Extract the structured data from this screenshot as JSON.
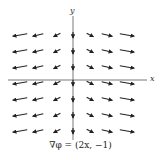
{
  "figure": {
    "title": "",
    "caption": "∇φ = (2x, −1)",
    "axes": {
      "x_label": "x",
      "y_label": "y"
    },
    "colors": {
      "arrow": "#222222",
      "axis": "#555555",
      "background": "#ffffff"
    }
  },
  "vector_field": {
    "field": "(2x, -1)",
    "columns_x": [
      -3,
      -2,
      -1,
      0,
      1,
      2,
      3
    ],
    "rows_y": [
      3,
      2,
      1,
      0,
      -1,
      -2,
      -3
    ],
    "note": "Arrows point left on the left half, right on the right half, all slightly downward; along the y-axis arrows point straight down"
  }
}
